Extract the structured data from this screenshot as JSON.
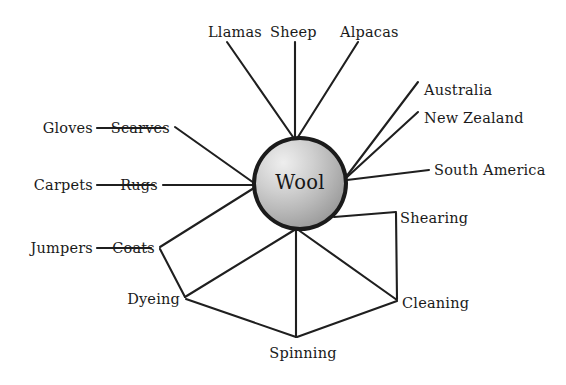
{
  "diagram": {
    "type": "spider-map",
    "title_hidden": "",
    "background_color": "#ffffff",
    "line_color": "#1f1f1f",
    "text_color": "#1a1a1a",
    "hub": {
      "label": "Wool",
      "center": [
        300,
        183
      ],
      "radius": 48,
      "outline_color": "#1b1b1b",
      "fill_light": "#eeeeee",
      "fill_dark": "#838383"
    },
    "nodes": [
      {
        "id": "llamas",
        "label": "Llamas",
        "x": 208,
        "y": 32,
        "anchor": "start"
      },
      {
        "id": "sheep",
        "label": "Sheep",
        "x": 270,
        "y": 32,
        "anchor": "start"
      },
      {
        "id": "alpacas",
        "label": "Alpacas",
        "x": 340,
        "y": 32,
        "anchor": "start"
      },
      {
        "id": "australia",
        "label": "Australia",
        "x": 424,
        "y": 90,
        "anchor": "start"
      },
      {
        "id": "new-zealand",
        "label": "New Zealand",
        "x": 424,
        "y": 118,
        "anchor": "start"
      },
      {
        "id": "south-america",
        "label": "South America",
        "x": 434,
        "y": 170,
        "anchor": "start"
      },
      {
        "id": "shearing",
        "label": "Shearing",
        "x": 400,
        "y": 218,
        "anchor": "start"
      },
      {
        "id": "cleaning",
        "label": "Cleaning",
        "x": 402,
        "y": 303,
        "anchor": "start"
      },
      {
        "id": "spinning",
        "label": "Spinning",
        "x": 303,
        "y": 353,
        "anchor": "middle"
      },
      {
        "id": "dyeing",
        "label": "Dyeing",
        "x": 180,
        "y": 299,
        "anchor": "end"
      },
      {
        "id": "coats",
        "label": "Coats",
        "x": 155,
        "y": 248,
        "anchor": "end"
      },
      {
        "id": "jumpers",
        "label": "Jumpers",
        "x": 93,
        "y": 248,
        "anchor": "end"
      },
      {
        "id": "rugs",
        "label": "Rugs",
        "x": 158,
        "y": 185,
        "anchor": "end"
      },
      {
        "id": "carpets",
        "label": "Carpets",
        "x": 93,
        "y": 185,
        "anchor": "end"
      },
      {
        "id": "scarves",
        "label": "Scarves",
        "x": 170,
        "y": 128,
        "anchor": "end"
      },
      {
        "id": "gloves",
        "label": "Gloves",
        "x": 93,
        "y": 128,
        "anchor": "end"
      }
    ],
    "edges": [
      {
        "from": "hub",
        "to": "llamas",
        "points": [
          [
            293,
            137
          ],
          [
            227,
            42
          ]
        ]
      },
      {
        "from": "hub",
        "to": "sheep",
        "points": [
          [
            295,
            137
          ],
          [
            295,
            42
          ]
        ]
      },
      {
        "from": "hub",
        "to": "alpacas",
        "points": [
          [
            298,
            137
          ],
          [
            358,
            42
          ]
        ]
      },
      {
        "from": "hub",
        "to": "australia",
        "points": [
          [
            346,
            177
          ],
          [
            418,
            82
          ]
        ]
      },
      {
        "from": "hub",
        "to": "new-zealand",
        "points": [
          [
            346,
            178
          ],
          [
            418,
            112
          ]
        ]
      },
      {
        "from": "hub",
        "to": "south-america",
        "points": [
          [
            347,
            180
          ],
          [
            429,
            170
          ]
        ]
      },
      {
        "from": "hub",
        "to": "scarves",
        "points": [
          [
            254,
            183
          ],
          [
            175,
            127
          ]
        ]
      },
      {
        "from": "hub",
        "to": "rugs",
        "points": [
          [
            253,
            185
          ],
          [
            163,
            185
          ]
        ]
      },
      {
        "from": "hub",
        "to": "coats",
        "points": [
          [
            254,
            188
          ],
          [
            160,
            247
          ]
        ]
      },
      {
        "from": "hub",
        "to": "dyeing",
        "points": [
          [
            296,
            229
          ],
          [
            185,
            297
          ]
        ]
      },
      {
        "from": "hub",
        "to": "spinning",
        "points": [
          [
            296,
            229
          ],
          [
            296,
            337
          ]
        ]
      },
      {
        "from": "hub",
        "to": "cleaning",
        "points": [
          [
            297,
            229
          ],
          [
            397,
            300
          ]
        ]
      },
      {
        "from": "hub",
        "to": "shearing",
        "points": [
          [
            334,
            217
          ],
          [
            396,
            212
          ]
        ]
      },
      {
        "from": "gloves",
        "to": "scarves",
        "points": [
          [
            97,
            128
          ],
          [
            165,
            128
          ]
        ]
      },
      {
        "from": "carpets",
        "to": "rugs",
        "points": [
          [
            97,
            185
          ],
          [
            154,
            185
          ]
        ]
      },
      {
        "from": "jumpers",
        "to": "coats",
        "points": [
          [
            97,
            248
          ],
          [
            151,
            248
          ]
        ]
      },
      {
        "from": "coats",
        "to": "dyeing",
        "points": [
          [
            160,
            249
          ],
          [
            185,
            297
          ]
        ]
      },
      {
        "from": "dyeing",
        "to": "spinning",
        "points": [
          [
            186,
            299
          ],
          [
            296,
            337
          ]
        ]
      },
      {
        "from": "spinning",
        "to": "cleaning",
        "points": [
          [
            297,
            337
          ],
          [
            397,
            301
          ]
        ]
      },
      {
        "from": "cleaning",
        "to": "shearing",
        "points": [
          [
            397,
            299
          ],
          [
            396,
            213
          ]
        ]
      }
    ]
  }
}
